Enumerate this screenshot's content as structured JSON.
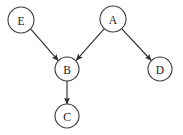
{
  "diagram": {
    "type": "directed-graph",
    "width": 183,
    "height": 135,
    "background_color": "#ffffff",
    "node_fill_color": "#ffffff",
    "node_stroke_color": "#3a3a3a",
    "edge_color": "#2e2e2e",
    "label_color": "#1a1a1a",
    "nodes": [
      {
        "id": "E",
        "label": "E",
        "cx": 21,
        "cy": 20,
        "r": 13
      },
      {
        "id": "A",
        "label": "A",
        "cx": 113,
        "cy": 19,
        "r": 13
      },
      {
        "id": "B",
        "label": "B",
        "cx": 67,
        "cy": 69,
        "r": 12
      },
      {
        "id": "C",
        "label": "C",
        "cx": 67,
        "cy": 116,
        "r": 12
      },
      {
        "id": "D",
        "label": "D",
        "cx": 160,
        "cy": 69,
        "r": 12
      }
    ],
    "edges": [
      {
        "id": "E-B",
        "from": "E",
        "to": "B",
        "directed": true,
        "x1": 30.6,
        "y1": 28.8,
        "x2": 58.3,
        "y2": 60.6
      },
      {
        "id": "A-B",
        "from": "A",
        "to": "B",
        "directed": true,
        "x1": 104.3,
        "y1": 28.6,
        "x2": 76.2,
        "y2": 60.3
      },
      {
        "id": "A-D",
        "from": "A",
        "to": "D",
        "directed": true,
        "x1": 121.6,
        "y1": 28.6,
        "x2": 151.3,
        "y2": 60.5
      },
      {
        "id": "B-C",
        "from": "B",
        "to": "C",
        "directed": true,
        "x1": 67,
        "y1": 81,
        "x2": 67,
        "y2": 104
      }
    ]
  }
}
